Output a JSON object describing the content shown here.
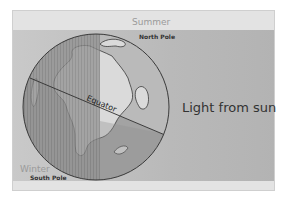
{
  "diagram": {
    "labels": {
      "top_season": "Summer",
      "top_pole": "North Pole",
      "bottom_season": "Winter",
      "bottom_pole": "South Pole",
      "equator": "Equator",
      "light": "Light from sun"
    },
    "colors": {
      "background": "#e3e3e3",
      "light_band": "#bcbcbc",
      "ocean_day": "#9c9c9c",
      "ocean_night": "#8a8a8a",
      "land_day": "#dcdcdc",
      "land_night": "#a8a8a8",
      "outline": "#3a3a3a"
    }
  }
}
